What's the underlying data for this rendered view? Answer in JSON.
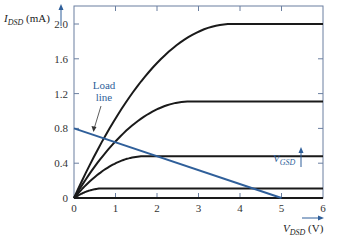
{
  "chart_data": {
    "type": "line",
    "title": "",
    "xlabel": "V_DSD (V)",
    "ylabel": "I_DSD (mA)",
    "xlim": [
      0,
      6
    ],
    "ylim": [
      0,
      2.2
    ],
    "x_ticks": [
      "0",
      "1",
      "2",
      "3",
      "4",
      "5",
      "6"
    ],
    "y_ticks": [
      "0",
      "0.4",
      "0.8",
      "1.2",
      "1.6",
      "2.0"
    ],
    "grid": false,
    "series": [
      {
        "name": "V_GSD highest",
        "saturation_current": 2.0,
        "knee_voltage": 3.8,
        "color": "#1a1a1a"
      },
      {
        "name": "V_GSD 3",
        "saturation_current": 1.11,
        "knee_voltage": 2.8,
        "color": "#1a1a1a"
      },
      {
        "name": "V_GSD 2",
        "saturation_current": 0.48,
        "knee_voltage": 1.7,
        "color": "#1a1a1a"
      },
      {
        "name": "V_GSD 1",
        "saturation_current": 0.11,
        "knee_voltage": 0.7,
        "color": "#1a1a1a"
      },
      {
        "name": "V_GSD 0",
        "saturation_current": 0.0,
        "knee_voltage": 0.0,
        "color": "#1a1a1a"
      }
    ],
    "load_line": {
      "x": [
        0,
        5
      ],
      "y": [
        0.8,
        0
      ],
      "color": "#2f5f9a"
    },
    "annotations": [
      {
        "text": "Load line",
        "points_to": [
          0.6,
          0.7
        ],
        "color": "#2f5f9a"
      },
      {
        "text": "V_GSD",
        "arrow": "up",
        "color": "#2f5f9a"
      }
    ]
  },
  "labels": {
    "y_main": "I",
    "y_sub": "DSD",
    "y_unit": " (mA)",
    "x_main": "V",
    "x_sub": "DSD",
    "x_unit": " (V)",
    "load_line_1": "Load",
    "load_line_2": "line",
    "vgsd_main": "V",
    "vgsd_sub": "GSD"
  }
}
